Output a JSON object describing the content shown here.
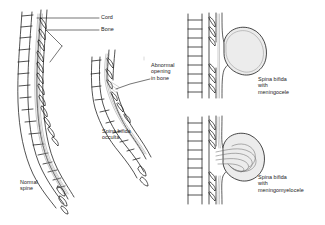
{
  "figure": {
    "background_color": "#ffffff",
    "ink_color": "#1a1a1a",
    "sac_fill_color": "#ececec",
    "cord_color": "#9a9a9a"
  },
  "panels": [
    {
      "id": "normal-spine",
      "name": "Normal spine",
      "caption": "Normal\nspine",
      "position": "left",
      "callouts": [
        {
          "id": "cord",
          "label": "Cord"
        },
        {
          "id": "bone",
          "label": "Bone"
        }
      ]
    },
    {
      "id": "spina-bifida-occulta",
      "name": "Spina bifida occulta",
      "caption": "Spina bifida\nocculta",
      "position": "center",
      "callouts": [
        {
          "id": "abnormal-opening",
          "label": "Abnormal\nopening\nin bone"
        }
      ]
    },
    {
      "id": "spina-bifida-meningocele",
      "name": "Spina bifida with meningocele",
      "caption": "Spina bifida\nwith\nmeningocele",
      "position": "top-right",
      "callouts": []
    },
    {
      "id": "spina-bifida-meningomyelocele",
      "name": "Spina bifida with meningomyelocele",
      "caption": "Spina bifida\nwith\nmeningomyelocele",
      "position": "bottom-right",
      "callouts": []
    }
  ],
  "labels": {
    "cord": "Cord",
    "bone": "Bone",
    "abnormal_opening": "Abnormal\nopening\nin bone",
    "normal_spine": "Normal\nspine",
    "spina_bifida_occulta": "Spina bifida\nocculta",
    "meningocele": "Spina bifida\nwith\nmeningocele",
    "meningomyelocele": "Spina bifida\nwith\nmeningomyelocele"
  }
}
